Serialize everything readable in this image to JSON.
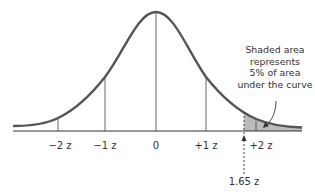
{
  "diagram": {
    "type": "normal-distribution",
    "axis_labels": [
      {
        "id": "minus2",
        "text": "−2 z",
        "x": 60
      },
      {
        "id": "minus1",
        "text": "−1 z",
        "x": 105
      },
      {
        "id": "zero",
        "text": "0",
        "x": 156
      },
      {
        "id": "plus1",
        "text": "+1 z",
        "x": 206
      },
      {
        "id": "plus2",
        "text": "+2 z",
        "x": 259
      }
    ],
    "critical_value": {
      "text": "1.65 z",
      "x": 244
    },
    "annotation": {
      "lines": [
        "Shaded area",
        "represents",
        "5% of area",
        "under the curve"
      ]
    },
    "colors": {
      "curve": "#555555",
      "shade": "#bbbbbb",
      "axis": "#333333",
      "guides": "#555555"
    }
  }
}
